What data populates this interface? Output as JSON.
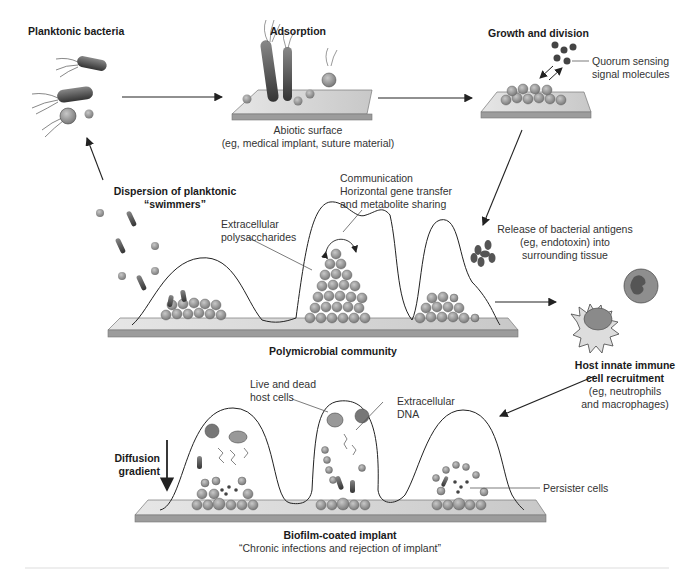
{
  "figure": {
    "stages": {
      "planktonic": {
        "title": "Planktonic bacteria"
      },
      "adsorption": {
        "title": "Adsorption",
        "surface_line1": "Abiotic surface",
        "surface_line2": "(eg, medical implant, suture material)"
      },
      "growth": {
        "title": "Growth and division",
        "qs_line1": "Quorum sensing",
        "qs_line2": "signal molecules"
      },
      "dispersion": {
        "line1": "Dispersion of planktonic",
        "line2": "“swimmers”"
      },
      "community": {
        "title": "Polymicrobial community",
        "eps_line1": "Extracellular",
        "eps_line2": "polysaccharides",
        "comm_line1": "Communication",
        "comm_line2": "Horizontal gene transfer",
        "comm_line3": "and metabolite sharing"
      },
      "antigens": {
        "line1": "Release of bacterial antigens",
        "line2": "(eg, endotoxin) into",
        "line3": "surrounding tissue"
      },
      "immune": {
        "line1": "Host innate immune",
        "line2": "cell recruitment",
        "line3": "(eg, neutrophils",
        "line4": "and macrophages)"
      },
      "implant": {
        "title": "Biofilm-coated implant",
        "subtitle": "“Chronic infections and rejection of implant”",
        "host_line1": "Live and dead",
        "host_line2": "host cells",
        "dna_line1": "Extracellular",
        "dna_line2": "DNA",
        "persister": "Persister cells",
        "diffusion_line1": "Diffusion",
        "diffusion_line2": "gradient"
      }
    },
    "colors": {
      "cell_fill": "#9a9a9a",
      "cell_dark": "#555555",
      "surface": "#d8d8d8",
      "surface_edge": "#8a8a8a",
      "line": "#222222"
    }
  }
}
